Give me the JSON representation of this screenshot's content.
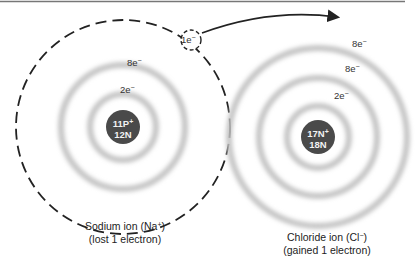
{
  "diagram": {
    "type": "ionic-bond-electron-transfer",
    "colors": {
      "nucleus": "#4a4a4a",
      "shell": "#c8c8c8",
      "line": "#222222",
      "background": "#ffffff"
    },
    "transfer_electron": {
      "label": "1e",
      "charge": "−"
    },
    "sodium": {
      "nucleus_line1": "11P",
      "nucleus_line1_sup": "+",
      "nucleus_line2": "12N",
      "shells": [
        {
          "label": "2e",
          "sup": "−"
        },
        {
          "label": "8e",
          "sup": "−"
        }
      ],
      "caption_line1": "Sodium ion (Na",
      "caption_line1_sup": "+",
      "caption_line1_end": ")",
      "caption_line2": "(lost 1 electron)"
    },
    "chloride": {
      "nucleus_line1": "17N",
      "nucleus_line1_sup": "+",
      "nucleus_line2": "18N",
      "shells": [
        {
          "label": "2e",
          "sup": "−"
        },
        {
          "label": "8e",
          "sup": "−"
        },
        {
          "label": "8e",
          "sup": "−"
        }
      ],
      "caption_line1": "Chloride ion (Cl",
      "caption_line1_sup": "−",
      "caption_line1_end": ")",
      "caption_line2": "(gained 1 electron)"
    }
  }
}
